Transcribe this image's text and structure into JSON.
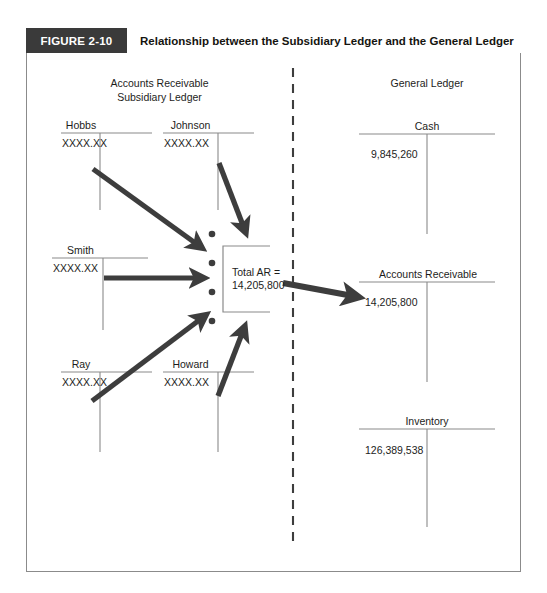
{
  "figure": {
    "number_label": "FIGURE 2-10",
    "title": "Relationship between the Subsidiary Ledger and the General Ledger"
  },
  "left_panel": {
    "heading_line1": "Accounts Receivable",
    "heading_line2": "Subsidiary Ledger",
    "accounts": [
      {
        "name": "Hobbs",
        "amount": "XXXX.XX"
      },
      {
        "name": "Johnson",
        "amount": "XXXX.XX"
      },
      {
        "name": "Smith",
        "amount": "XXXX.XX"
      },
      {
        "name": "Ray",
        "amount": "XXXX.XX"
      },
      {
        "name": "Howard",
        "amount": "XXXX.XX"
      }
    ]
  },
  "center": {
    "total_label": "Total AR =",
    "total_value": "14,205,800",
    "dot_count": 4
  },
  "right_panel": {
    "heading": "General Ledger",
    "accounts": [
      {
        "name": "Cash",
        "amount": "9,845,260"
      },
      {
        "name": "Accounts Receivable",
        "amount": "14,205,800"
      },
      {
        "name": "Inventory",
        "amount": "126,389,538"
      }
    ]
  },
  "colors": {
    "header_bar": "#3a3a3a",
    "header_text": "#ffffff",
    "title_text": "#15140f",
    "frame_border": "#8b8b8b",
    "arrow": "#3d3d3d",
    "ledger_rule": "#8a8a8a",
    "divider": "#3d3d3d",
    "body_text": "#1d1d1b"
  }
}
